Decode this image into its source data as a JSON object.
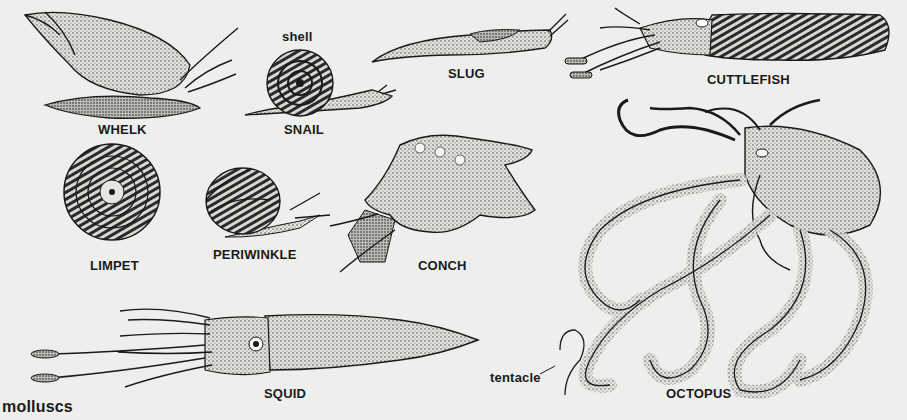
{
  "figure": {
    "caption": "molluscs",
    "background_color": "#eeeeec",
    "ink_color": "#1a1a1a"
  },
  "labels": {
    "whelk": "WHELK",
    "shell": "shell",
    "snail": "SNAIL",
    "slug": "SLUG",
    "cuttlefish": "CUTTLEFISH",
    "limpet": "LIMPET",
    "periwinkle": "PERIWINKLE",
    "conch": "CONCH",
    "squid": "SQUID",
    "tentacle": "tentacle",
    "octopus": "OCTOPUS"
  },
  "illustrations": [
    {
      "name": "whelk",
      "icon": "whelk-illustration"
    },
    {
      "name": "snail",
      "icon": "snail-illustration"
    },
    {
      "name": "slug",
      "icon": "slug-illustration"
    },
    {
      "name": "cuttlefish",
      "icon": "cuttlefish-illustration"
    },
    {
      "name": "limpet",
      "icon": "limpet-illustration"
    },
    {
      "name": "periwinkle",
      "icon": "periwinkle-illustration"
    },
    {
      "name": "conch",
      "icon": "conch-illustration"
    },
    {
      "name": "squid",
      "icon": "squid-illustration"
    },
    {
      "name": "octopus",
      "icon": "octopus-illustration"
    }
  ]
}
